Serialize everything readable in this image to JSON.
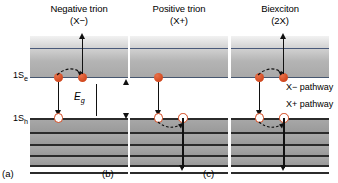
{
  "figure": {
    "type": "energy-level-diagram",
    "levels": {
      "conduction_label": "1S",
      "conduction_sub": "e",
      "valence_label": "1S",
      "valence_sub": "h",
      "gap_label": "E",
      "gap_sub": "g"
    },
    "colors": {
      "electron": "#d2471d",
      "hole_outline": "#d2471d",
      "band_line": "#4a5a7a",
      "valence_line": "#2b2b2b",
      "arrow": "#111111"
    },
    "panels": [
      {
        "letter": "(a)",
        "title": "Negative trion",
        "symbol": "(X−)",
        "electrons": 2,
        "holes": 1,
        "excited_carrier": "electron",
        "pathways": []
      },
      {
        "letter": "(b)",
        "title": "Positive trion",
        "symbol": "(X+)",
        "electrons": 1,
        "holes": 2,
        "excited_carrier": "hole",
        "pathways": []
      },
      {
        "letter": "(c)",
        "title": "Biexciton",
        "symbol": "(2X)",
        "electrons": 2,
        "holes": 2,
        "excited_carrier": "both",
        "pathways": [
          {
            "label": "X− pathway"
          },
          {
            "label": "X+ pathway"
          }
        ]
      }
    ]
  }
}
